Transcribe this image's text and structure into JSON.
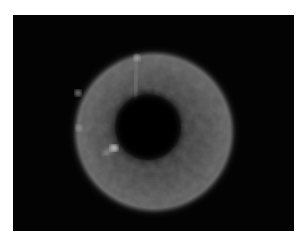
{
  "image": {
    "description": "Grayscale fluorescence micrograph of a ring-shaped particle with a dark central hole on a black background",
    "background_color": "#030303",
    "border_color": "#ffffff"
  }
}
